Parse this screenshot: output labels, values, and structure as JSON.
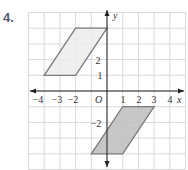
{
  "problem": {
    "number": "4."
  },
  "axes": {
    "x_label": "x",
    "y_label": "y",
    "origin_label": "O",
    "x_tick_labels": [
      "−4",
      "−3",
      "−2",
      "1",
      "2",
      "3",
      "4"
    ],
    "y_tick_labels": [
      "2",
      "1",
      "−2"
    ]
  },
  "grid": {
    "x_min": -5,
    "x_max": 5,
    "y_min": -5,
    "y_max": 5,
    "spacing_px": 15.7
  },
  "shapes": [
    {
      "name": "upper-parallelogram",
      "vertices": [
        [
          -4,
          1
        ],
        [
          -2,
          1
        ],
        [
          0,
          4
        ],
        [
          -2,
          4
        ]
      ],
      "fill": "#ececec",
      "stroke": "#7a7a7a"
    },
    {
      "name": "lower-parallelogram",
      "vertices": [
        [
          1,
          -1
        ],
        [
          3,
          -1
        ],
        [
          1,
          -4
        ],
        [
          -1,
          -4
        ]
      ],
      "fill": "#bdbdbd",
      "stroke": "#7a7a7a"
    }
  ],
  "colors": {
    "grid": "#cfcfcf",
    "axis": "#222222"
  }
}
